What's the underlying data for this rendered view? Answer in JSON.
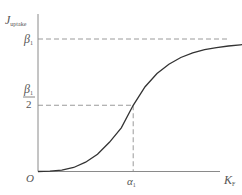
{
  "chart_data": {
    "type": "line",
    "title": "",
    "xlabel": "K",
    "xlabel_sub": "F",
    "ylabel": "J",
    "ylabel_sub": "uptake",
    "origin_label": "O",
    "curve": "sigmoid",
    "series": [
      {
        "name": "J_uptake vs K_F",
        "x": [
          0,
          0.1,
          0.2,
          0.3,
          0.4,
          0.5,
          0.6,
          0.7,
          0.8,
          0.9,
          1.0,
          1.1,
          1.2,
          1.3,
          1.4,
          1.5,
          1.6,
          1.7,
          1.8
        ],
        "y": [
          0,
          0.002,
          0.01,
          0.03,
          0.07,
          0.13,
          0.22,
          0.33,
          0.5,
          0.64,
          0.74,
          0.81,
          0.86,
          0.895,
          0.92,
          0.935,
          0.947,
          0.956,
          0.963
        ]
      }
    ],
    "reference_lines": [
      {
        "axis": "y",
        "value": 1.0,
        "label": "β",
        "label_sub": "1",
        "style": "dashed"
      },
      {
        "axis": "y",
        "value": 0.5,
        "label_num": "β",
        "label_num_sub": "1",
        "label_den": "2",
        "style": "dashed"
      },
      {
        "axis": "x",
        "value": 0.8,
        "label": "α",
        "label_sub": "1",
        "style": "dashed"
      }
    ],
    "xlim": [
      0,
      1.9
    ],
    "ylim": [
      0,
      1.3
    ],
    "grid": false,
    "legend": "none"
  }
}
